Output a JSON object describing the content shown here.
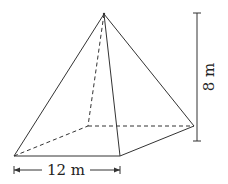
{
  "figure": {
    "type": "square pyramid",
    "base_label": "12 m",
    "height_label": "8 m",
    "colors": {
      "line": "#333333",
      "background": "#ffffff"
    }
  }
}
